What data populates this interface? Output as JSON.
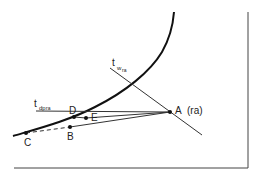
{
  "diagram": {
    "title": "",
    "labels": {
      "A": "A",
      "A_suffix": "(ra)",
      "B": "B",
      "C": "C",
      "D": "D",
      "E": "E",
      "tw_main": "t",
      "tw_sub": "w",
      "tw_subsub": "ra",
      "tdp_main": "t",
      "tdp_sub": "dp",
      "tdp_subsub": "ra"
    },
    "colors": {
      "line": "#222222",
      "background": "#ffffff"
    }
  }
}
